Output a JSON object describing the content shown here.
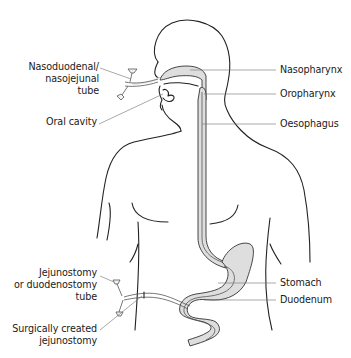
{
  "figure": {
    "type": "anatomical-diagram",
    "colors": {
      "outline": "#222222",
      "tract_fill": "#dedede",
      "leader_line": "#6e6e6e",
      "text": "#1a1a1a",
      "background": "#ffffff"
    }
  },
  "labels": {
    "left": [
      {
        "id": "nasoduodenal",
        "lines": [
          "Nasoduodenal/",
          "nasojejunal",
          "tube"
        ]
      },
      {
        "id": "oral_cavity",
        "lines": [
          "Oral cavity"
        ]
      },
      {
        "id": "jejunostomy_tube",
        "lines": [
          "Jejunostomy",
          "or duodenostomy",
          "tube"
        ]
      },
      {
        "id": "surgical_jejunostomy",
        "lines": [
          "Surgically created",
          "jejunostomy"
        ]
      }
    ],
    "right": [
      {
        "id": "nasopharynx",
        "lines": [
          "Nasopharynx"
        ]
      },
      {
        "id": "oropharynx",
        "lines": [
          "Oropharynx"
        ]
      },
      {
        "id": "oesophagus",
        "lines": [
          "Oesophagus"
        ]
      },
      {
        "id": "stomach",
        "lines": [
          "Stomach"
        ]
      },
      {
        "id": "duodenum",
        "lines": [
          "Duodenum"
        ]
      }
    ]
  }
}
